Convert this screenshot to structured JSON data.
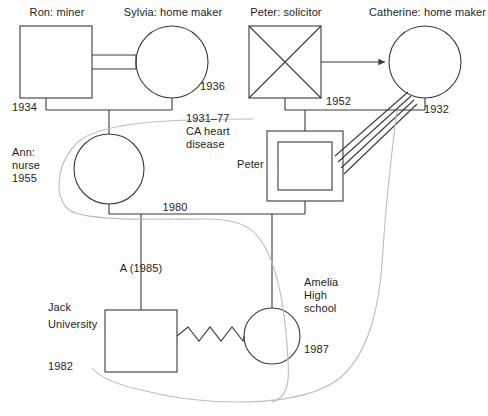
{
  "diagram": {
    "type": "genogram",
    "colors": {
      "stroke": "#3a3a3a",
      "stroke_light": "#b9b9b9",
      "background": "#ffffff",
      "text": "#1d1d1d"
    }
  },
  "people": [
    {
      "id": "ron",
      "shape": "square",
      "gender": "male",
      "name": "Ron: miner",
      "year": "1934",
      "deceased": false
    },
    {
      "id": "sylvia",
      "shape": "circle",
      "gender": "female",
      "name": "Sylvia: home maker",
      "year": "1936",
      "deceased": false
    },
    {
      "id": "peter_sr",
      "shape": "square-crossed",
      "gender": "male",
      "name": "Peter: solicitor",
      "year": "1952",
      "deceased": true,
      "note": "1931–77\nCA heart\ndisease"
    },
    {
      "id": "catherine",
      "shape": "circle",
      "gender": "female",
      "name": "Catherine: home maker",
      "year": "1932",
      "deceased": false
    },
    {
      "id": "ann",
      "shape": "circle",
      "gender": "female",
      "name": "Ann:\nnurse\n1955",
      "year": "1955",
      "deceased": false
    },
    {
      "id": "peter_jr",
      "shape": "double-square",
      "gender": "male",
      "name": "Peter",
      "year": "",
      "deceased": false,
      "identified_patient": true
    },
    {
      "id": "jack",
      "shape": "square",
      "gender": "male",
      "name": "Jack\nUniversity",
      "year": "1982",
      "deceased": false
    },
    {
      "id": "amelia",
      "shape": "circle",
      "gender": "female",
      "name": "Amelia\nHigh\nschool",
      "year": "1987",
      "deceased": false
    }
  ],
  "labels": {
    "ron_name": "Ron: miner",
    "ron_year": "1934",
    "sylvia_name": "Sylvia: home maker",
    "sylvia_year": "1936",
    "peter_sr_name": "Peter: solicitor",
    "peter_sr_year": "1952",
    "catherine_name": "Catherine: home maker",
    "catherine_year": "1932",
    "peter_sr_note_l1": "1931–77",
    "peter_sr_note_l2": "CA heart",
    "peter_sr_note_l3": "disease",
    "ann_l1": "Ann:",
    "ann_l2": "nurse",
    "ann_l3": "1955",
    "peter_jr_name": "Peter",
    "marriage_1980": "1980",
    "pregnancy_loss": "A (1985)",
    "jack_l1": "Jack",
    "jack_l2": "University",
    "jack_year": "1982",
    "amelia_l1": "Amelia",
    "amelia_l2": "High",
    "amelia_l3": "school",
    "amelia_year": "1987"
  },
  "relationships": [
    {
      "from": "ron",
      "to": "sylvia",
      "kind": "marriage-double-line",
      "year": "1934"
    },
    {
      "from": "peter_sr",
      "to": "catherine",
      "kind": "arrow-line",
      "year": "1952"
    },
    {
      "from": "ron+sylvia",
      "to": "ann",
      "kind": "child-line"
    },
    {
      "from": "peter_sr+catherine",
      "to": "peter_jr",
      "kind": "child-line"
    },
    {
      "from": "ann",
      "to": "peter_jr",
      "kind": "marriage-line",
      "year": "1980"
    },
    {
      "from": "ann+peter_jr",
      "to": "jack",
      "kind": "child-line",
      "label": "A (1985)"
    },
    {
      "from": "ann+peter_jr",
      "to": "amelia",
      "kind": "child-line"
    },
    {
      "from": "jack",
      "to": "amelia",
      "kind": "conflict-zigzag"
    },
    {
      "from": "catherine",
      "to": "peter_jr",
      "kind": "enmeshed-multi-line"
    },
    {
      "from": "ann",
      "to": "amelia",
      "kind": "emotional-curve"
    },
    {
      "from": "peter_jr",
      "to": "amelia",
      "kind": "emotional-curve"
    }
  ]
}
